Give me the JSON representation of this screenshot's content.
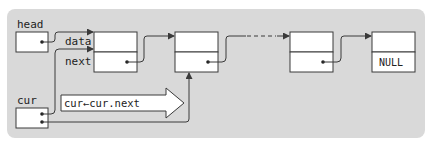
{
  "diagram": {
    "type": "linked-list-traversal",
    "colors": {
      "panel_bg": "#d9d9d9",
      "box_fill": "#ffffff",
      "stroke": "#3a3a3a",
      "text": "#222222"
    },
    "labels": {
      "head": "head",
      "cur": "cur",
      "data": "data",
      "next": "next",
      "null": "NULL",
      "step": "cur←cur.next"
    },
    "nodes": [
      {
        "id": "node-1",
        "next": "node-2"
      },
      {
        "id": "node-2",
        "next": "..."
      },
      {
        "id": "node-3",
        "next": "node-4"
      },
      {
        "id": "node-4",
        "next": "NULL"
      }
    ],
    "pointers": [
      {
        "name": "head",
        "points_to": "node-1"
      },
      {
        "name": "cur (before)",
        "points_to": "node-1"
      },
      {
        "name": "cur (after)",
        "points_to": "node-2"
      }
    ]
  }
}
